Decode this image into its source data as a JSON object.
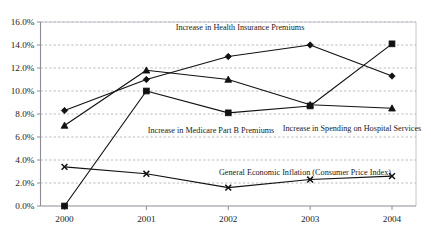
{
  "chart_data": {
    "type": "line",
    "title": "",
    "subtitle": "",
    "xlabel": "",
    "ylabel": "",
    "categories": [
      "2000",
      "2001",
      "2002",
      "2003",
      "2004"
    ],
    "x_tick_labels": [
      "2000",
      "2001",
      "2002",
      "2003",
      "2004"
    ],
    "y_tick_labels": [
      "0.0%",
      "2.0%",
      "4.0%",
      "6.0%",
      "8.0%",
      "10.0%",
      "12.0%",
      "14.0%",
      "16.0%"
    ],
    "y_tick_values": [
      0,
      2,
      4,
      6,
      8,
      10,
      12,
      14,
      16
    ],
    "ylim": [
      0,
      16
    ],
    "y_unit": "%",
    "grid": "horizontal-dashed",
    "legend": "inline-annotations",
    "series": [
      {
        "name": "Increase in Health Insurance Premiums",
        "marker": "diamond",
        "values": [
          8.3,
          11.0,
          13.0,
          14.0,
          11.3
        ],
        "annotation": "Increase in Health Insurance Premiums",
        "annotation_x": 240,
        "annotation_y": 30
      },
      {
        "name": "Increase in Medicare Part B Premiums",
        "marker": "square",
        "values": [
          0.0,
          10.0,
          8.1,
          8.7,
          14.1
        ],
        "annotation": "Increase in Medicare Part B Premiums",
        "annotation_x": 211,
        "annotation_y": 133
      },
      {
        "name": "Increase in Spending on Hospital Services",
        "marker": "triangle",
        "values": [
          7.0,
          11.8,
          11.0,
          8.8,
          8.5
        ],
        "annotation": "Increase in Spending on Hospital Services",
        "annotation_x": 352,
        "annotation_y": 131
      },
      {
        "name": "General Economic Inflation (Consumer Price Index)",
        "marker": "x",
        "values": [
          3.4,
          2.8,
          1.6,
          2.3,
          2.6
        ],
        "annotation": "General Economic Inflation (Consumer Price Index)",
        "annotation_x": 305,
        "annotation_y": 175
      }
    ],
    "colors": {
      "line": "#111111",
      "marker": "#111111",
      "grid": "#9a9aa6",
      "axis": "#8c8c96",
      "background": "#ffffff",
      "text": "#1a1a1a"
    }
  }
}
